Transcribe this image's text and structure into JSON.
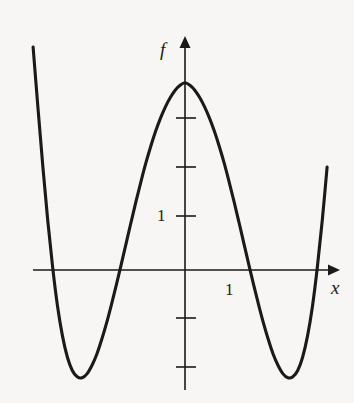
{
  "figure": {
    "background_color": "#f7f6f4",
    "ink_color": "#1a1a1a",
    "axis_label_y": "f",
    "axis_label_x": "x",
    "tick_label_y": "1",
    "tick_label_x": "1"
  },
  "chart_data": {
    "type": "line",
    "title": "",
    "xlabel": "x",
    "ylabel": "f",
    "grid": false,
    "legend": null,
    "xlim": [
      -3.1,
      2.95
    ],
    "ylim": [
      -2.45,
      4.55
    ],
    "x_ticks": [
      1
    ],
    "x_tick_labels": [
      "1"
    ],
    "y_ticks": [
      -2,
      -1,
      1,
      2,
      3
    ],
    "y_tick_labels": [
      "",
      "",
      "1",
      "",
      ""
    ],
    "labeled_y_tick": 1,
    "roots": [
      -2.14,
      -1.06,
      0.98,
      2.04
    ],
    "local_maximum": {
      "x": 0,
      "y": 4.1
    },
    "local_minima": [
      {
        "x": -1.65,
        "y": -2.2
      },
      {
        "x": 1.51,
        "y": -2.2
      }
    ],
    "x": [
      -3.1,
      -3.0,
      -2.9,
      -2.8,
      -2.7,
      -2.6,
      -2.5,
      -2.4,
      -2.3,
      -2.2,
      -2.1,
      -2.0,
      -1.9,
      -1.8,
      -1.7,
      -1.6,
      -1.5,
      -1.4,
      -1.3,
      -1.2,
      -1.1,
      -1.0,
      -0.9,
      -0.8,
      -0.7,
      -0.6,
      -0.5,
      -0.4,
      -0.3,
      -0.2,
      -0.1,
      0.0,
      0.1,
      0.2,
      0.3,
      0.4,
      0.5,
      0.6,
      0.7,
      0.8,
      0.9,
      1.0,
      1.1,
      1.2,
      1.3,
      1.4,
      1.5,
      1.6,
      1.7,
      1.8,
      1.9,
      2.0,
      2.1,
      2.2,
      2.3,
      2.4,
      2.5,
      2.6,
      2.7,
      2.8,
      2.9
    ],
    "series": [
      {
        "name": "f",
        "values": [
          4.55,
          3.3,
          2.1,
          1.0,
          0.05,
          -0.75,
          -1.35,
          -1.78,
          -2.05,
          -2.18,
          -2.2,
          -2.12,
          -1.95,
          -1.72,
          -1.42,
          -1.08,
          -0.7,
          -0.3,
          0.12,
          0.55,
          0.98,
          1.4,
          1.8,
          2.18,
          2.52,
          2.83,
          3.1,
          3.33,
          3.52,
          3.67,
          3.77,
          3.82,
          3.77,
          3.67,
          3.52,
          3.33,
          3.1,
          2.83,
          2.52,
          2.18,
          1.8,
          1.4,
          0.98,
          0.55,
          0.12,
          -0.3,
          -0.7,
          -1.08,
          -1.42,
          -1.72,
          -1.95,
          -2.12,
          -2.2,
          -2.18,
          -2.05,
          -1.78,
          -1.35,
          -0.75,
          0.05,
          1.0,
          2.1
        ]
      }
    ]
  }
}
